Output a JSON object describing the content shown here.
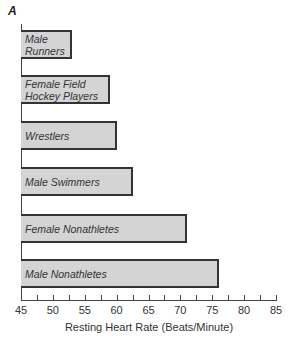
{
  "chart_data": {
    "type": "bar",
    "orientation": "horizontal",
    "title": "A",
    "categories": [
      "Male Runners",
      "Female Field Hockey Players",
      "Wrestlers",
      "Male Swimmers",
      "Female Nonathletes",
      "Male Nonathletes"
    ],
    "category_lines": [
      [
        "Male",
        "Runners"
      ],
      [
        "Female Field",
        "Hockey Players"
      ],
      [
        "Wrestlers"
      ],
      [
        "Male Swimmers"
      ],
      [
        "Female Nonathletes"
      ],
      [
        "Male Nonathletes"
      ]
    ],
    "values": [
      53,
      59,
      60,
      62.5,
      71,
      76
    ],
    "xlabel": "Resting Heart Rate (Beats/Minute)",
    "ylabel": "",
    "xlim": [
      45,
      85
    ],
    "xticks": [
      45,
      50,
      55,
      60,
      65,
      70,
      75,
      80,
      85
    ],
    "minor_tick_step": 2.5,
    "grid": false,
    "legend": null,
    "bar_color": "#d4d4d4",
    "bar_edge_color": "#333333"
  }
}
